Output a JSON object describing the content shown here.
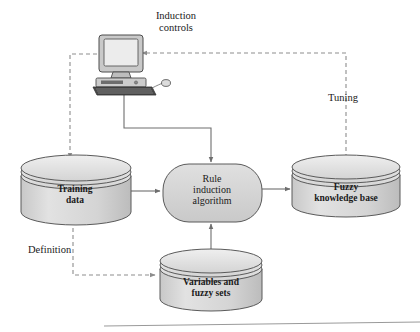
{
  "figure": {
    "background": "#ffffff",
    "baseline_rule_color": "#9a9a9a"
  },
  "palette": {
    "node_fill_top": "#dedede",
    "node_fill_body": "#d2d2d2",
    "node_stroke": "#5a5a5a",
    "process_fill": "#d5d5d5",
    "process_stroke": "#5a5a5a",
    "line_solid": "#6e6e6e",
    "line_dashed": "#8d8d8d",
    "text": "#1a1a1a",
    "monitor_screen": "#e6e6e6",
    "monitor_case": "#c9c9c9",
    "keyboard": "#4a4a4a"
  },
  "nodes": {
    "computer": {
      "icon": "desktop-computer-icon",
      "label": ""
    },
    "training_data": {
      "label_line1": "Training",
      "label_line2": "data",
      "shape": "cylinder"
    },
    "rule_induction": {
      "label_line1": "Rule",
      "label_line2": "induction",
      "label_line3": "algorithm",
      "shape": "rounded-rectangle"
    },
    "fuzzy_knowledge_base": {
      "label_line1": "Fuzzy",
      "label_line2": "knowledge base",
      "shape": "cylinder"
    },
    "variables_fuzzy_sets": {
      "label_line1": "Variables and",
      "label_line2": "fuzzy sets",
      "shape": "cylinder"
    }
  },
  "edge_labels": {
    "induction_controls_line1": "Induction",
    "induction_controls_line2": "controls",
    "tuning": "Tuning",
    "definition": "Definition"
  },
  "edges": [
    {
      "name": "computer-to-training-data",
      "style": "dashed",
      "from": "computer",
      "to": "training_data",
      "label": ""
    },
    {
      "name": "computer-to-rule-induction",
      "style": "solid",
      "from": "computer",
      "to": "rule_induction",
      "label": ""
    },
    {
      "name": "fuzzy-kb-to-computer",
      "style": "dashed",
      "from": "fuzzy_knowledge_base",
      "to": "computer",
      "label": "Tuning"
    },
    {
      "name": "training-data-to-rule-induction",
      "style": "solid",
      "from": "training_data",
      "to": "rule_induction",
      "label": ""
    },
    {
      "name": "rule-induction-to-fuzzy-kb",
      "style": "solid",
      "from": "rule_induction",
      "to": "fuzzy_knowledge_base",
      "label": ""
    },
    {
      "name": "variables-to-rule-induction",
      "style": "solid",
      "from": "variables_fuzzy_sets",
      "to": "rule_induction",
      "label": ""
    },
    {
      "name": "training-data-to-variables",
      "style": "dashed",
      "from": "training_data",
      "to": "variables_fuzzy_sets",
      "label": "Definition"
    }
  ]
}
